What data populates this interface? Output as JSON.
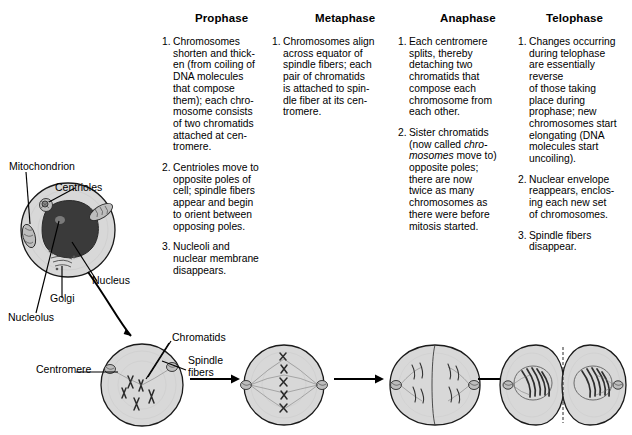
{
  "figure": {
    "title_note": "Stages of mitosis with interphase cell and phase descriptions"
  },
  "columns": [
    {
      "header": "Prophase",
      "items": [
        {
          "num": "1.",
          "lines": [
            "Chromosomes",
            "shorten and thick-",
            "en (from coiling of",
            "DNA molecules",
            "that compose",
            "them); each chro-",
            "mosome consists",
            "of two chromatids",
            "attached at cen-",
            "tromere."
          ]
        },
        {
          "num": "2.",
          "lines": [
            "Centrioles move to",
            "opposite poles of",
            "cell; spindle fibers",
            "appear and begin",
            "to orient between",
            "opposing poles."
          ]
        },
        {
          "num": "3.",
          "lines": [
            "Nucleoli and",
            "nuclear membrane",
            "disappears."
          ]
        }
      ]
    },
    {
      "header": "Metaphase",
      "items": [
        {
          "num": "1.",
          "lines": [
            "Chromosomes align",
            "across equator of",
            "spindle fibers; each",
            "pair of chromatids",
            "is attached to spin-",
            "dle fiber at its cen-",
            "tromere."
          ]
        }
      ]
    },
    {
      "header": "Anaphase",
      "items": [
        {
          "num": "1.",
          "lines": [
            "Each centromere",
            "splits, thereby",
            "detaching two",
            "chromatids that",
            "compose each",
            "chromosome from",
            "each other."
          ]
        },
        {
          "num": "2.",
          "lines": [
            "Sister chromatids",
            "(now called chro-",
            "mosomes) move to",
            "opposite poles;",
            "there are now",
            "twice as many",
            "chromosomes as",
            "there were before",
            "mitosis started."
          ],
          "italic_lines": [
            1,
            2
          ]
        }
      ]
    },
    {
      "header": "Telophase",
      "items": [
        {
          "num": "1.",
          "lines": [
            "Changes occurring",
            "during telophase",
            "are essentially",
            "reverse",
            "of those taking",
            "place during",
            "prophase; new",
            "chromosomes start",
            "elongating (DNA",
            "molecules start",
            "uncoiling)."
          ]
        },
        {
          "num": "2.",
          "lines": [
            "Nuclear envelope",
            "reappears, enclos-",
            "ing each new set",
            "of chromosomes."
          ]
        },
        {
          "num": "3.",
          "lines": [
            "Spindle fibers",
            "disappear."
          ]
        }
      ]
    }
  ],
  "interphase_labels": {
    "mitochondrion": "Mitochondrion",
    "centrioles": "Centrioles",
    "nucleus": "Nucleus",
    "golgi": "Golgi",
    "nucleolus": "Nucleolus"
  },
  "prophase_cell_labels": {
    "centromere": "Centromere",
    "chromatids": "Chromatids",
    "spindle_fibers_l1": "Spindle",
    "spindle_fibers_l2": "fibers"
  },
  "colors": {
    "background": "#ffffff",
    "ink": "#000000",
    "cell_fill": "#d8d8d8",
    "nucleus_fill": "#3a3a3a",
    "organelle_fill": "#bdbdbd",
    "fiber": "#707070"
  }
}
